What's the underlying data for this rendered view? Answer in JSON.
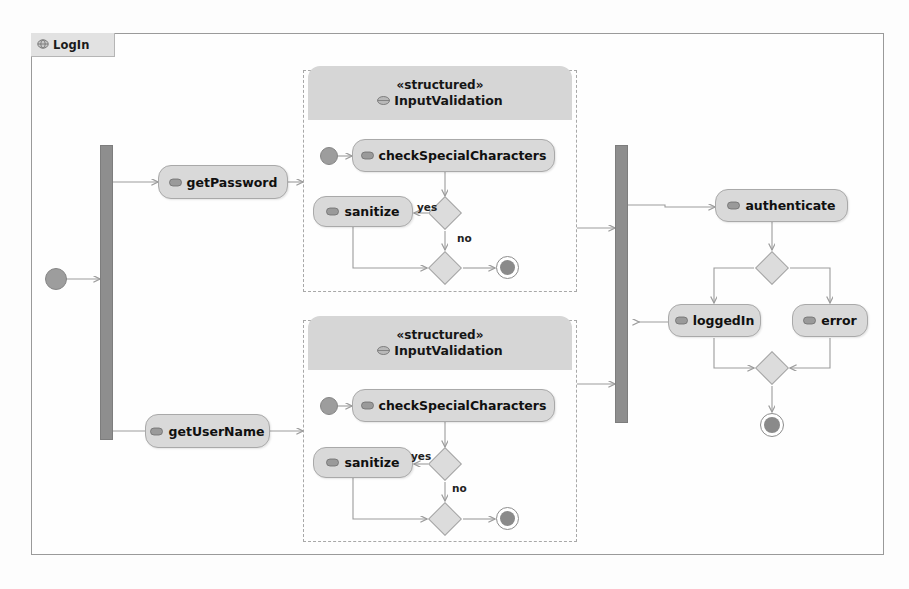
{
  "frame": {
    "title": "LogIn",
    "icon": "activity-package-icon"
  },
  "colors": {
    "node_fill": "#d9d9d9",
    "node_border": "#a9a9a9",
    "bar_fill": "#8e8e8e",
    "header_fill": "#d6d6d6",
    "edge": "#9b9b9b",
    "frame_border": "#9a9a9a",
    "title_fill": "#e2e2e2"
  },
  "nodes": {
    "initial_main": {
      "kind": "initial-node"
    },
    "fork_bar": {
      "kind": "fork-bar"
    },
    "join_bar": {
      "kind": "join-bar"
    },
    "get_password": {
      "kind": "action",
      "label": "getPassword"
    },
    "get_username": {
      "kind": "action",
      "label": "getUserName"
    },
    "authenticate": {
      "kind": "action",
      "label": "authenticate"
    },
    "logged_in": {
      "kind": "action",
      "label": "loggedIn"
    },
    "error": {
      "kind": "action",
      "label": "error"
    },
    "final_main": {
      "kind": "activity-final-node"
    }
  },
  "structured_nodes": [
    {
      "stereotype": "«structured»",
      "name": "InputValidation",
      "inner": {
        "initial": {
          "kind": "initial-node"
        },
        "check": {
          "kind": "action",
          "label": "checkSpecialCharacters"
        },
        "sanitize": {
          "kind": "action",
          "label": "sanitize"
        },
        "decision_top": {
          "kind": "decision-node"
        },
        "merge_bottom": {
          "kind": "merge-node"
        },
        "final": {
          "kind": "activity-final-node"
        },
        "edge_labels": {
          "yes": "yes",
          "no": "no"
        }
      }
    },
    {
      "stereotype": "«structured»",
      "name": "InputValidation",
      "inner": {
        "initial": {
          "kind": "initial-node"
        },
        "check": {
          "kind": "action",
          "label": "checkSpecialCharacters"
        },
        "sanitize": {
          "kind": "action",
          "label": "sanitize"
        },
        "decision_top": {
          "kind": "decision-node"
        },
        "merge_bottom": {
          "kind": "merge-node"
        },
        "final": {
          "kind": "activity-final-node"
        },
        "edge_labels": {
          "yes": "yes",
          "no": "no"
        }
      }
    }
  ],
  "decision_right": {
    "kind": "decision-node"
  },
  "merge_right": {
    "kind": "merge-node"
  }
}
